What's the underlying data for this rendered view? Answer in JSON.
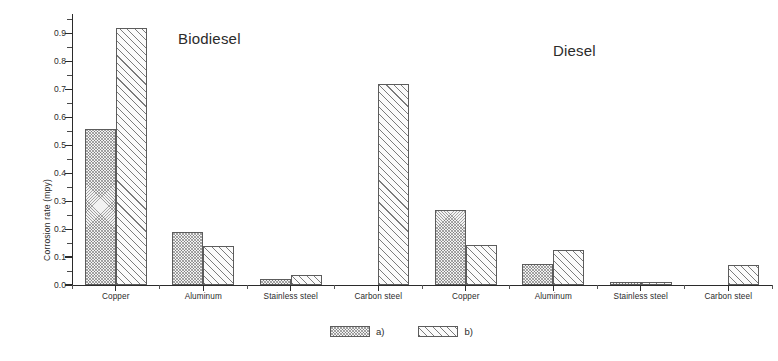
{
  "chart_data": {
    "type": "bar",
    "title": "",
    "xlabel": "",
    "ylabel": "Corrosion rate (mpy)",
    "ylim": [
      0.0,
      0.97
    ],
    "ytick_labels": [
      "0.0",
      "0.1",
      "0.2",
      "0.3",
      "0.4",
      "0.5",
      "0.6",
      "0.7",
      "0.8",
      "0.9"
    ],
    "ytick_values": [
      0.0,
      0.1,
      0.2,
      0.3,
      0.4,
      0.5,
      0.6,
      0.7,
      0.8,
      0.9
    ],
    "grid": false,
    "legend_position": "bottom-center",
    "legend": [
      {
        "key": "a",
        "label": "a)",
        "pattern": "dense-crosshatch"
      },
      {
        "key": "b",
        "label": "b)",
        "pattern": "diagonal-hatch"
      }
    ],
    "group_titles": [
      {
        "label": "Biodiesel",
        "x_fraction": 0.27
      },
      {
        "label": "Diesel",
        "x_fraction": 0.78
      }
    ],
    "categories": [
      "Copper",
      "Aluminum",
      "Stainless steel",
      "Carbon steel",
      "Copper",
      "Aluminum",
      "Stainless steel",
      "Carbon steel"
    ],
    "groups": [
      {
        "name": "Biodiesel",
        "categories": [
          "Copper",
          "Aluminum",
          "Stainless steel",
          "Carbon steel"
        ],
        "series": [
          {
            "name": "a)",
            "values": [
              0.56,
              0.19,
              0.02,
              null
            ]
          },
          {
            "name": "b)",
            "values": [
              0.92,
              0.14,
              0.035,
              0.72
            ]
          }
        ]
      },
      {
        "name": "Diesel",
        "categories": [
          "Copper",
          "Aluminum",
          "Stainless steel",
          "Carbon steel"
        ],
        "series": [
          {
            "name": "a)",
            "values": [
              0.27,
              0.075,
              0.01,
              null
            ]
          },
          {
            "name": "b)",
            "values": [
              0.145,
              0.125,
              0.012,
              0.07
            ]
          }
        ]
      }
    ],
    "series": [
      {
        "name": "a)",
        "values": [
          0.56,
          0.19,
          0.02,
          null,
          0.27,
          0.075,
          0.01,
          null
        ]
      },
      {
        "name": "b)",
        "values": [
          0.92,
          0.14,
          0.035,
          0.72,
          0.145,
          0.125,
          0.012,
          0.07
        ]
      }
    ]
  }
}
